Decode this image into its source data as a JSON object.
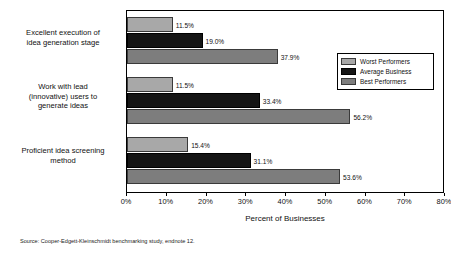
{
  "chart_data": {
    "type": "bar",
    "orientation": "horizontal",
    "title": "",
    "xlabel": "Percent of Businesses",
    "ylabel": "",
    "xlim": [
      0,
      80
    ],
    "grid": false,
    "legend_position": "right-top",
    "xticks": [
      "0%",
      "10%",
      "20%",
      "30%",
      "40%",
      "50%",
      "60%",
      "70%",
      "80%"
    ],
    "xtick_values": [
      0,
      10,
      20,
      30,
      40,
      50,
      60,
      70,
      80
    ],
    "categories": [
      "Excellent execution of idea generation stage",
      "Work with lead (innovative) users to generate ideas",
      "Proficient idea screening method"
    ],
    "category_lines": [
      [
        "Excellent execution of",
        "idea generation stage"
      ],
      [
        "Work with lead",
        "(innovative) users to",
        "generate ideas"
      ],
      [
        "Proficient idea screening",
        "method"
      ]
    ],
    "series": [
      {
        "name": "Worst Performers",
        "color": "#a8a8a8",
        "values": [
          11.5,
          11.5,
          15.4
        ],
        "labels": [
          "11.5%",
          "11.5%",
          "15.4%"
        ]
      },
      {
        "name": "Average Business",
        "color": "#151515",
        "values": [
          19.0,
          33.4,
          31.1
        ],
        "labels": [
          "19.0%",
          "33.4%",
          "31.1%"
        ]
      },
      {
        "name": "Best Performers",
        "color": "#7d7d7d",
        "values": [
          37.9,
          56.2,
          53.6
        ],
        "labels": [
          "37.9%",
          "56.2%",
          "53.6%"
        ]
      }
    ]
  },
  "legend": {
    "items": [
      {
        "label": "Worst Performers",
        "key": "worst"
      },
      {
        "label": "Average Business",
        "key": "average"
      },
      {
        "label": "Best Performers",
        "key": "best"
      }
    ]
  },
  "axis": {
    "x_title": "Percent of Businesses"
  },
  "footer": {
    "source": "Source: Cooper-Edgett-Kleinschmidt benchmarking study, endnote 12."
  }
}
